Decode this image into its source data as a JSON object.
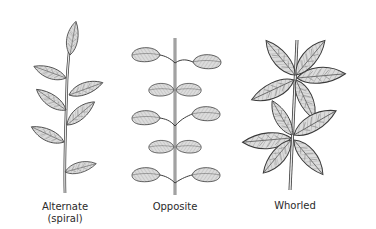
{
  "diagram": {
    "panels": [
      {
        "id": "alternate",
        "label": "Alternate",
        "sublabel": "(spiral)"
      },
      {
        "id": "opposite",
        "label": "Opposite"
      },
      {
        "id": "whorled",
        "label": "Whorled"
      }
    ],
    "colors": {
      "background": "#ffffff",
      "leaf_fill": "#d9d9d9",
      "outline": "#3a3a3a",
      "vein": "#7a7a7a",
      "text": "#2a2a2a"
    }
  }
}
